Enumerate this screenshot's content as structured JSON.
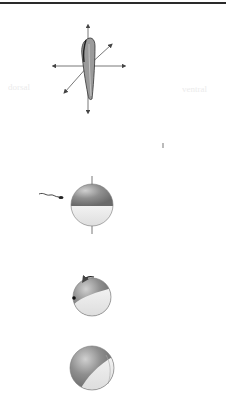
{
  "figure": {
    "panels": [
      {
        "id": "axes",
        "label": "body-axes-embryo"
      },
      {
        "id": "fertilization",
        "label": "sperm-approaching-egg"
      },
      {
        "id": "rotation",
        "label": "cortical-rotation-egg"
      },
      {
        "id": "gray-crescent",
        "label": "egg-after-rotation"
      }
    ],
    "ghost_text": {
      "left": "dorsal",
      "right": "ventral"
    },
    "colors": {
      "dark_hemisphere": "#8a8a8a",
      "light_hemisphere": "#e6e6e6",
      "line": "#444444",
      "rule": "#2a2a2a"
    }
  }
}
